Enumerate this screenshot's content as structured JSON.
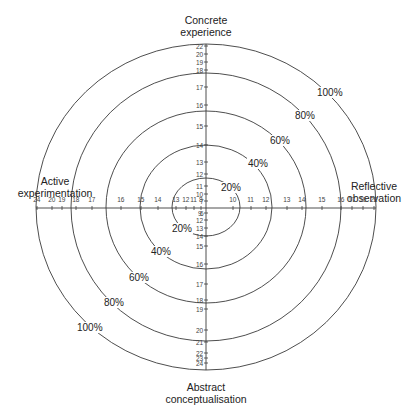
{
  "diagram": {
    "type": "learning-style-radar",
    "center": {
      "x": 206,
      "y": 207
    },
    "rings": [
      {
        "label": "20%",
        "rx": 34,
        "ry": 29,
        "label_pos": {
          "x": 220,
          "y": 182
        }
      },
      {
        "label": "40%",
        "rx": 66,
        "ry": 62,
        "label_pos": {
          "x": 247,
          "y": 158
        }
      },
      {
        "label": "60%",
        "rx": 100,
        "ry": 96,
        "label_pos": {
          "x": 269,
          "y": 135
        }
      },
      {
        "label": "80%",
        "rx": 135,
        "ry": 134,
        "label_pos": {
          "x": 294,
          "y": 110
        }
      },
      {
        "label": "100%",
        "rx": 170,
        "ry": 163,
        "label_pos": {
          "x": 316,
          "y": 87
        }
      }
    ],
    "ring_labels_lower_left": [
      {
        "label": "20%",
        "x": 171,
        "y": 223
      },
      {
        "label": "40%",
        "x": 150,
        "y": 246
      },
      {
        "label": "60%",
        "x": 128,
        "y": 272
      },
      {
        "label": "80%",
        "x": 103,
        "y": 297
      },
      {
        "label": "100%",
        "x": 76,
        "y": 322
      }
    ],
    "poles": {
      "top": {
        "line1": "Concrete",
        "line2": "experience",
        "x": 206,
        "y": 14
      },
      "right": {
        "line1": "Reflective",
        "line2": "observation",
        "x": 374,
        "y": 180
      },
      "bottom": {
        "line1": "Abstract",
        "line2": "conceptualisation",
        "x": 206,
        "y": 381
      },
      "left": {
        "line1": "Active",
        "line2": "experimentation",
        "x": 55,
        "y": 175
      }
    },
    "axes": {
      "top": [
        {
          "v": "22",
          "y": 46
        },
        {
          "v": "20",
          "y": 54
        },
        {
          "v": "19",
          "y": 62
        },
        {
          "v": "18",
          "y": 70
        },
        {
          "v": "17",
          "y": 87
        },
        {
          "v": "16",
          "y": 105
        },
        {
          "v": "15",
          "y": 126
        },
        {
          "v": "14",
          "y": 145
        },
        {
          "v": "13",
          "y": 162
        },
        {
          "v": "12",
          "y": 174
        },
        {
          "v": "11",
          "y": 186
        },
        {
          "v": "10",
          "y": 194
        },
        {
          "v": "7",
          "y": 201
        }
      ],
      "bottom": [
        {
          "v": "6",
          "y": 213
        },
        {
          "v": "12",
          "y": 220
        },
        {
          "v": "13",
          "y": 228
        },
        {
          "v": "14",
          "y": 236
        },
        {
          "v": "15",
          "y": 246
        },
        {
          "v": "16",
          "y": 264
        },
        {
          "v": "17",
          "y": 284
        },
        {
          "v": "18",
          "y": 300
        },
        {
          "v": "19",
          "y": 309
        },
        {
          "v": "20",
          "y": 330
        },
        {
          "v": "21",
          "y": 342
        },
        {
          "v": "22",
          "y": 353
        },
        {
          "v": "23",
          "y": 358
        },
        {
          "v": "24",
          "y": 363
        }
      ],
      "bottom_left_label": {
        "v": "9",
        "x": 198,
        "y": 213
      },
      "left": [
        {
          "v": "24",
          "x": 37
        },
        {
          "v": "20",
          "x": 52
        },
        {
          "v": "19",
          "x": 62
        },
        {
          "v": "18",
          "x": 76
        },
        {
          "v": "17",
          "x": 92
        },
        {
          "v": "16",
          "x": 121
        },
        {
          "v": "15",
          "x": 141
        },
        {
          "v": "14",
          "x": 158
        },
        {
          "v": "13",
          "x": 176
        },
        {
          "v": "12",
          "x": 186
        },
        {
          "v": "11",
          "x": 194
        },
        {
          "v": "8",
          "x": 201
        }
      ],
      "right": [
        {
          "v": "10",
          "x": 233
        },
        {
          "v": "11",
          "x": 251
        },
        {
          "v": "12",
          "x": 266
        },
        {
          "v": "13",
          "x": 287
        },
        {
          "v": "14",
          "x": 302
        },
        {
          "v": "15",
          "x": 322
        },
        {
          "v": "16",
          "x": 341
        },
        {
          "v": "17",
          "x": 352
        },
        {
          "v": "19",
          "x": 363
        },
        {
          "v": "22",
          "x": 374
        }
      ]
    },
    "colors": {
      "line": "#3a3a3a",
      "text": "#222222",
      "tick_text": "#444444",
      "background": "#ffffff"
    }
  }
}
